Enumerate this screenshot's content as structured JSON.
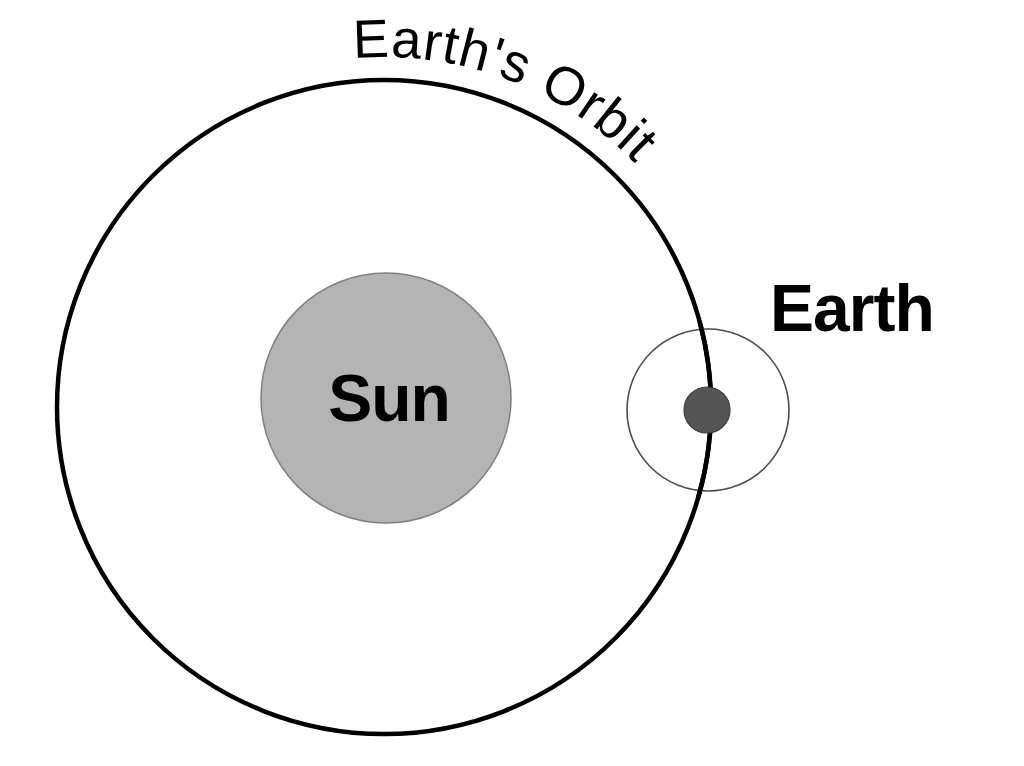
{
  "diagram": {
    "background_color": "#ffffff",
    "width": 1024,
    "height": 766
  },
  "labels": {
    "sun": "Sun",
    "earth": "Earth",
    "earth_orbit": "Earth's Orbit"
  },
  "colors": {
    "sun_fill": "#b4b4b4",
    "sun_stroke": "#808080",
    "earth_fill": "#555555",
    "earth_stroke": "#3c3c3c",
    "orbit_stroke": "#000000",
    "moon_orbit_stroke": "#4d4d4d",
    "text": "#000000"
  },
  "shapes": {
    "earth_orbit_circle": {
      "name": "earth-orbit",
      "cx": 384,
      "cy": 407,
      "r": 327,
      "stroke_width": 4.5,
      "fill": "none"
    },
    "sun_disc": {
      "name": "sun",
      "cx": 386,
      "cy": 398,
      "r": 125,
      "stroke_width": 1.5
    },
    "moon_orbit_circle": {
      "name": "moon-orbit",
      "cx": 708,
      "cy": 410,
      "r": 81,
      "stroke_width": 1.6,
      "fill": "none"
    },
    "earth_disc": {
      "name": "earth",
      "cx": 707,
      "cy": 410,
      "r": 23,
      "stroke_width": 1.2
    }
  },
  "text_placement": {
    "sun_label": {
      "x": 389,
      "y": 421,
      "font_size": 66,
      "anchor": "middle"
    },
    "earth_label": {
      "x": 770,
      "y": 331,
      "font_size": 66,
      "anchor": "start"
    },
    "earth_orbit_label": {
      "font_size": 54,
      "letter_spacing": 1,
      "start_offset": "2.5%",
      "path_cx": 384,
      "path_cy": 407,
      "path_r": 350
    }
  }
}
